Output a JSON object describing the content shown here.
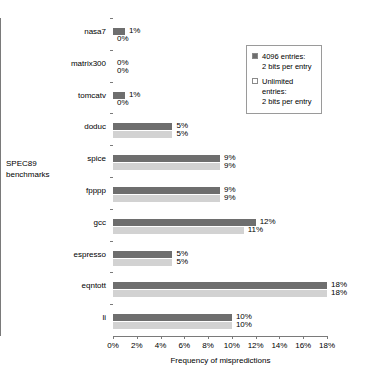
{
  "chart_data": {
    "type": "bar",
    "orientation": "horizontal",
    "title": "",
    "xlabel": "Frequency of mispredictions",
    "ylabel": "SPEC89\nbenchmarks",
    "xlim": [
      0,
      18
    ],
    "xticks": [
      "0%",
      "2%",
      "4%",
      "6%",
      "8%",
      "10%",
      "12%",
      "14%",
      "16%",
      "18%"
    ],
    "xtick_values": [
      0,
      2,
      4,
      6,
      8,
      10,
      12,
      14,
      16,
      18
    ],
    "grid": false,
    "legend_position": "upper right",
    "categories": [
      "nasa7",
      "matrix300",
      "tomcatv",
      "doduc",
      "spice",
      "fpppp",
      "gcc",
      "espresso",
      "eqntott",
      "li"
    ],
    "series": [
      {
        "name": "4096 entries:\n2 bits per entry",
        "color": "#6e6e6e",
        "values": [
          1,
          0,
          1,
          5,
          9,
          9,
          12,
          5,
          18,
          10
        ],
        "labels": [
          "1%",
          "0%",
          "1%",
          "5%",
          "9%",
          "9%",
          "12%",
          "5%",
          "18%",
          "10%"
        ]
      },
      {
        "name": "Unlimited entries:\n2 bits per entry",
        "color": "#d2d2d2",
        "values": [
          0,
          0,
          0,
          5,
          9,
          9,
          11,
          5,
          18,
          10
        ],
        "labels": [
          "0%",
          "0%",
          "0%",
          "5%",
          "9%",
          "9%",
          "11%",
          "5%",
          "18%",
          "10%"
        ]
      }
    ]
  },
  "legend": {
    "items": [
      {
        "swatch": "dark",
        "label": "4096 entries:\n2 bits per entry"
      },
      {
        "swatch": "light",
        "label": "Unlimited entries:\n2 bits per entry"
      }
    ]
  },
  "colors": {
    "series_a": "#6e6e6e",
    "series_b": "#d2d2d2",
    "axis": "#7a7a7a",
    "text": "#000000",
    "background": "#ffffff"
  }
}
